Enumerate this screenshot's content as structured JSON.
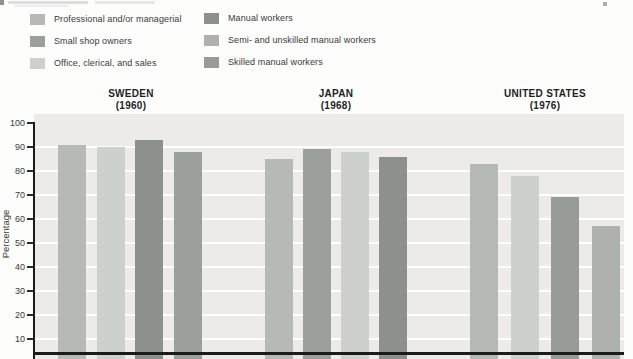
{
  "colors": {
    "professional": "#b6bab6",
    "small_shop": "#9ca09c",
    "office": "#cdd1cd",
    "manual": "#8d918d",
    "semi_unskilled": "#aeb2ae",
    "skilled": "#989c98",
    "plot_bg": "#edebe7",
    "gridline": "#ffffff",
    "axis": "#1b1b1b"
  },
  "legend": {
    "columns": [
      {
        "items": [
          {
            "label": "Professional and/or managerial",
            "color_key": "professional"
          },
          {
            "label": "Small shop owners",
            "color_key": "small_shop"
          },
          {
            "label": "Office, clerical, and sales",
            "color_key": "office"
          }
        ]
      },
      {
        "items": [
          {
            "label": "Manual workers",
            "color_key": "manual"
          },
          {
            "label": "Semi- and unskilled manual workers",
            "color_key": "semi_unskilled"
          },
          {
            "label": "Skilled manual workers",
            "color_key": "skilled"
          }
        ]
      }
    ]
  },
  "y_axis": {
    "label": "Percentage",
    "ticks": [
      100,
      90,
      80,
      70,
      60,
      50,
      40,
      30,
      20,
      10
    ]
  },
  "chart_data": {
    "type": "bar",
    "title": "",
    "ylabel": "Percentage",
    "ylim": [
      0,
      100
    ],
    "grid": "horizontal white gridlines every 10, bottom of axis cropped below 10",
    "legend_position": "top-left, two columns",
    "groups": [
      {
        "label": "SWEDEN",
        "year": "(1960)",
        "bars": [
          {
            "category": "Professional and/or managerial",
            "color_key": "professional",
            "value": 91
          },
          {
            "category": "Office, clerical, and sales",
            "color_key": "office",
            "value": 90
          },
          {
            "category": "Manual workers",
            "color_key": "manual",
            "value": 93
          },
          {
            "category": "Small shop owners",
            "color_key": "small_shop",
            "value": 88
          }
        ]
      },
      {
        "label": "JAPAN",
        "year": "(1968)",
        "bars": [
          {
            "category": "Professional and/or managerial",
            "color_key": "professional",
            "value": 85
          },
          {
            "category": "Small shop owners",
            "color_key": "small_shop",
            "value": 89
          },
          {
            "category": "Office, clerical, and sales",
            "color_key": "office",
            "value": 88
          },
          {
            "category": "Manual workers",
            "color_key": "manual",
            "value": 86
          }
        ]
      },
      {
        "label": "UNITED STATES",
        "year": "(1976)",
        "bars": [
          {
            "category": "Professional and/or managerial",
            "color_key": "professional",
            "value": 83
          },
          {
            "category": "Office, clerical, and sales",
            "color_key": "office",
            "value": 78
          },
          {
            "category": "Skilled manual workers",
            "color_key": "skilled",
            "value": 69
          },
          {
            "category": "Semi- and unskilled manual workers",
            "color_key": "semi_unskilled",
            "value": 57
          }
        ]
      }
    ]
  }
}
